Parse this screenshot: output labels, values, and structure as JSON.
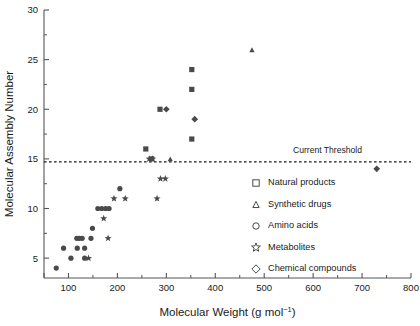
{
  "chart_data": {
    "type": "scatter",
    "title": "",
    "xlabel": "Molecular Weight (g mol−1)",
    "xlabel_base": "Molecular Weight (g mol",
    "xlabel_sup": "−1",
    "xlabel_tail": ")",
    "ylabel": "Molecular Assembly Number",
    "xlim": [
      50,
      800
    ],
    "ylim": [
      3,
      30
    ],
    "grid": false,
    "legend_position": "center-right",
    "x_ticks": [
      100,
      200,
      300,
      400,
      500,
      600,
      700,
      800
    ],
    "x_tick_labels": [
      "100",
      "200",
      "300",
      "400",
      "500",
      "600",
      "700",
      "800"
    ],
    "x_minor_ticks": [
      150,
      250,
      350,
      450,
      550,
      650,
      750
    ],
    "y_ticks": [
      5,
      10,
      15,
      20,
      25,
      30
    ],
    "y_tick_labels": [
      "5",
      "10",
      "15",
      "20",
      "25",
      "30"
    ],
    "y_minor_ticks": [
      7.5,
      12.5,
      17.5,
      22.5,
      27.5
    ],
    "annotations": [
      {
        "name": "current-threshold",
        "text": "Current Threshold",
        "type": "hline",
        "y": 14.7,
        "label_x": 700,
        "label_y": 15.6
      }
    ],
    "series": [
      {
        "name": "Natural products",
        "marker": "square",
        "legend_glyph": "square",
        "points": [
          [
            258,
            16
          ],
          [
            270,
            15
          ],
          [
            287,
            20
          ],
          [
            352,
            24
          ],
          [
            352,
            22
          ],
          [
            352,
            17
          ]
        ]
      },
      {
        "name": "Synthetic drugs",
        "marker": "triangle",
        "legend_glyph": "triangle",
        "points": [
          [
            475,
            26
          ],
          [
            308,
            15
          ]
        ]
      },
      {
        "name": "Amino acids",
        "marker": "circle",
        "legend_glyph": "circle",
        "points": [
          [
            75,
            4
          ],
          [
            90,
            6
          ],
          [
            105,
            5
          ],
          [
            117,
            7
          ],
          [
            122,
            7
          ],
          [
            128,
            7
          ],
          [
            118,
            6
          ],
          [
            133,
            6
          ],
          [
            133,
            5
          ],
          [
            146,
            7
          ],
          [
            149,
            8
          ],
          [
            160,
            10
          ],
          [
            168,
            10
          ],
          [
            176,
            10
          ],
          [
            183,
            10
          ],
          [
            205,
            12
          ]
        ]
      },
      {
        "name": "Metabolites",
        "marker": "star",
        "legend_glyph": "star",
        "points": [
          [
            141,
            5
          ],
          [
            172,
            9
          ],
          [
            181,
            7
          ],
          [
            193,
            11
          ],
          [
            216,
            11
          ],
          [
            281,
            11
          ],
          [
            288,
            13
          ],
          [
            298,
            13
          ],
          [
            265,
            15
          ],
          [
            272,
            15
          ]
        ]
      },
      {
        "name": "Chemical compounds",
        "marker": "diamond",
        "legend_glyph": "diamond",
        "points": [
          [
            300,
            20
          ],
          [
            358,
            19
          ],
          [
            730,
            14
          ]
        ]
      }
    ],
    "legend_entries": [
      "Natural products",
      "Synthetic drugs",
      "Amino acids",
      "Metabolites",
      "Chemical compounds"
    ]
  }
}
